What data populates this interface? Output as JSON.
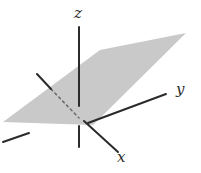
{
  "figure": {
    "kind": "3d-coordinate-axes-with-plane",
    "background_color": "#ffffff",
    "plane": {
      "name": "shaded-plane",
      "fill_color": "#c9c9c9",
      "opacity": 1,
      "vertices": [
        [
          3,
          122
        ],
        [
          100,
          50
        ],
        [
          186,
          33
        ],
        [
          93,
          125
        ]
      ]
    },
    "axes": [
      {
        "name": "z-axis",
        "label": "z",
        "label_position": [
          74,
          6
        ],
        "color": "#2b2b2b",
        "width": 2,
        "segments": [
          {
            "style": "solid",
            "from": [
              79,
              27
            ],
            "to": [
              79,
              106
            ]
          },
          {
            "style": "solid",
            "from": [
              79,
              126
            ],
            "to": [
              79,
              147
            ]
          }
        ]
      },
      {
        "name": "y-axis",
        "label": "y",
        "label_position": [
          176,
          82
        ],
        "color": "#2b2b2b",
        "width": 2,
        "segments": [
          {
            "style": "solid",
            "from": [
              88,
              123
            ],
            "to": [
              166,
              94
            ]
          },
          {
            "style": "solid",
            "from": [
              3,
              142
            ],
            "to": [
              29,
              133
            ]
          }
        ]
      },
      {
        "name": "x-axis",
        "label": "x",
        "label_position": [
          117,
          150
        ],
        "color": "#2b2b2b",
        "width": 2,
        "segments": [
          {
            "style": "solid",
            "from": [
              84,
              121
            ],
            "to": [
              118,
              152
            ]
          },
          {
            "style": "solid",
            "from": [
              37,
              74
            ],
            "to": [
              51,
              89
            ]
          },
          {
            "style": "dashed",
            "from": [
              51,
              89
            ],
            "to": [
              79,
              118
            ]
          }
        ]
      }
    ],
    "origin": [
      81,
      121
    ]
  }
}
